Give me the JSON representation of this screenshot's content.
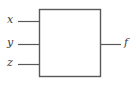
{
  "diagram": {
    "type": "block-diagram",
    "colors": {
      "stroke": "#595959",
      "box_fill": "#ffffff",
      "background": "#ffffff",
      "label": "#3a3a3a"
    },
    "block": {
      "name": "logic-block",
      "x": 39,
      "y": 9,
      "width": 62,
      "height": 68,
      "label": ""
    },
    "inputs": [
      {
        "label": "x",
        "line_y": 21,
        "line_x1": 18,
        "line_x2": 39,
        "label_x": 8,
        "label_y": 15
      },
      {
        "label": "y",
        "line_y": 44,
        "line_x1": 18,
        "line_x2": 39,
        "label_x": 8,
        "label_y": 38
      },
      {
        "label": "z",
        "line_y": 64,
        "line_x1": 18,
        "line_x2": 39,
        "label_x": 8,
        "label_y": 58
      }
    ],
    "outputs": [
      {
        "label": "f",
        "line_y": 44,
        "line_x1": 101,
        "line_x2": 121,
        "label_x": 124,
        "label_y": 38
      }
    ]
  }
}
